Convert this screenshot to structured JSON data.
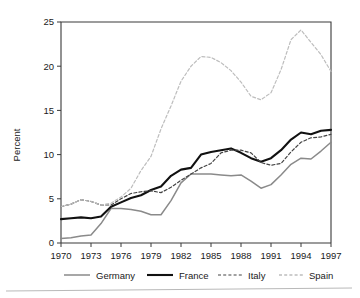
{
  "figure": {
    "background_color": "#ffffff",
    "plot_frame_color": "#3a3a3a"
  },
  "axes": {
    "ylabel": "Percent",
    "y_ticks": [
      "0",
      "5",
      "10",
      "15",
      "20",
      "25"
    ],
    "x_ticks": [
      "1970",
      "1973",
      "1976",
      "1979",
      "1982",
      "1985",
      "1988",
      "1991",
      "1994",
      "1997"
    ]
  },
  "legend": {
    "items": [
      {
        "label": "Germany",
        "color": "#8a8a8a",
        "style": "solid",
        "width": 1.5
      },
      {
        "label": "France",
        "color": "#111111",
        "style": "solid",
        "width": 2.1
      },
      {
        "label": "Italy",
        "color": "#444444",
        "style": "dashed",
        "width": 1.2
      },
      {
        "label": "Spain",
        "color": "#bdbdbd",
        "style": "dashed",
        "width": 1.3
      }
    ]
  },
  "chart_data": {
    "type": "line",
    "title": "",
    "xlabel": "",
    "ylabel": "Percent",
    "xlim": [
      1970,
      1997
    ],
    "ylim": [
      0,
      25
    ],
    "grid": false,
    "legend_position": "bottom",
    "x": [
      1970,
      1971,
      1972,
      1973,
      1974,
      1975,
      1976,
      1977,
      1978,
      1979,
      1980,
      1981,
      1982,
      1983,
      1984,
      1985,
      1986,
      1987,
      1988,
      1989,
      1990,
      1991,
      1992,
      1993,
      1994,
      1995,
      1996,
      1997
    ],
    "series": [
      {
        "name": "Germany",
        "color": "#8a8a8a",
        "style": "solid",
        "values": [
          0.5,
          0.6,
          0.8,
          0.9,
          2.2,
          3.9,
          3.9,
          3.8,
          3.6,
          3.2,
          3.2,
          4.8,
          6.8,
          7.8,
          7.8,
          7.8,
          7.7,
          7.6,
          7.7,
          7.0,
          6.2,
          6.6,
          7.7,
          8.9,
          9.6,
          9.5,
          10.4,
          11.4
        ]
      },
      {
        "name": "France",
        "color": "#111111",
        "style": "solid",
        "values": [
          2.7,
          2.8,
          2.9,
          2.8,
          3.0,
          4.1,
          4.6,
          5.1,
          5.4,
          6.0,
          6.4,
          7.6,
          8.3,
          8.5,
          10.0,
          10.3,
          10.5,
          10.7,
          10.2,
          9.6,
          9.2,
          9.6,
          10.5,
          11.7,
          12.5,
          12.3,
          12.7,
          12.8
        ]
      },
      {
        "name": "Italy",
        "color": "#444444",
        "style": "dashed",
        "values": [
          4.1,
          4.4,
          4.9,
          4.7,
          4.3,
          4.3,
          5.0,
          5.6,
          5.8,
          5.9,
          5.7,
          6.3,
          7.1,
          7.8,
          8.5,
          9.0,
          10.2,
          10.5,
          10.5,
          10.2,
          9.1,
          8.8,
          9.0,
          10.3,
          11.4,
          11.9,
          12.0,
          12.3
        ]
      },
      {
        "name": "Spain",
        "color": "#bdbdbd",
        "style": "dashed",
        "values": [
          4.1,
          4.4,
          4.9,
          4.7,
          4.3,
          4.5,
          5.2,
          6.2,
          8.2,
          9.8,
          12.9,
          15.5,
          18.3,
          20.0,
          21.1,
          21.0,
          20.4,
          19.5,
          18.2,
          16.6,
          16.2,
          17.0,
          19.6,
          23.0,
          24.1,
          22.7,
          21.3,
          19.4
        ]
      }
    ]
  }
}
